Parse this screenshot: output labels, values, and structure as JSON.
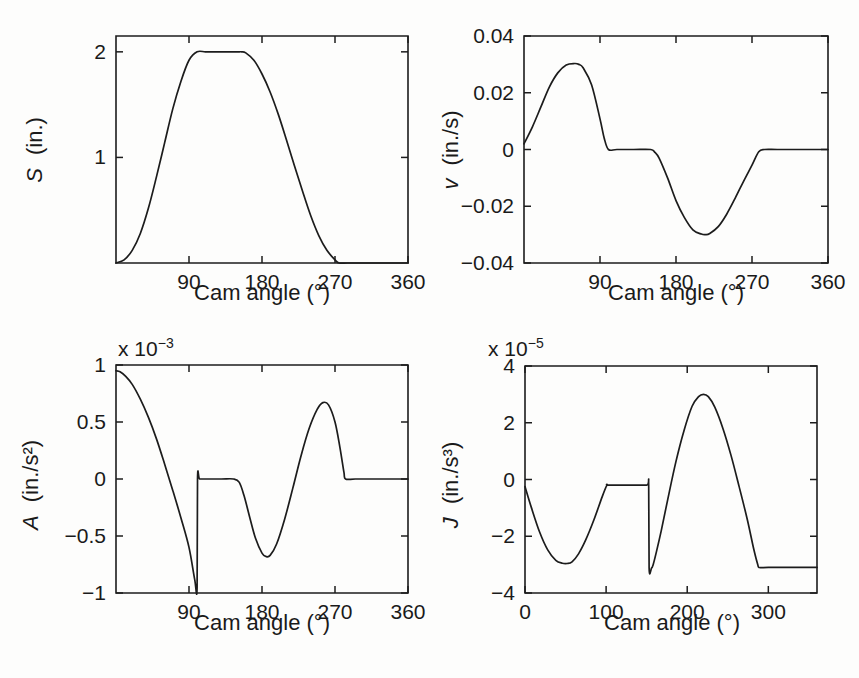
{
  "figure": {
    "name": "cam-motion-four-panel-figure",
    "background": "#fdfdfc",
    "line_color": "#1c1c1c",
    "text_color": "#1a1a1a"
  },
  "chart_data": [
    {
      "id": "panel-s",
      "type": "line",
      "title": "",
      "xlabel": "Cam angle (°)",
      "ylabel": "S (in.)",
      "ylabel_parts": {
        "symbol": "S",
        "units": "(in.)"
      },
      "exponent_label": "",
      "xlim": [
        0,
        360
      ],
      "ylim": [
        0,
        2.15
      ],
      "xticks": [
        90,
        180,
        270,
        360
      ],
      "xticklabels": [
        "90",
        "180",
        "270",
        "360"
      ],
      "yticks": [
        1,
        2
      ],
      "yticklabels": [
        "1",
        "2"
      ],
      "grid": false,
      "legend": "none",
      "x": [
        0,
        10,
        20,
        30,
        40,
        50,
        60,
        70,
        80,
        90,
        100,
        110,
        120,
        130,
        140,
        150,
        155,
        160,
        170,
        180,
        190,
        200,
        210,
        220,
        230,
        240,
        250,
        260,
        270,
        275,
        285,
        300,
        320,
        340,
        360
      ],
      "y": [
        0.0,
        0.03,
        0.12,
        0.28,
        0.52,
        0.82,
        1.14,
        1.46,
        1.72,
        1.92,
        2.0,
        2.0,
        2.0,
        2.0,
        2.0,
        2.0,
        2.0,
        1.99,
        1.92,
        1.79,
        1.62,
        1.41,
        1.17,
        0.92,
        0.68,
        0.45,
        0.26,
        0.12,
        0.03,
        0.0,
        0.0,
        0.0,
        0.0,
        0.0,
        0.0
      ]
    },
    {
      "id": "panel-v",
      "type": "line",
      "title": "",
      "xlabel": "Cam angle (°)",
      "ylabel": "v (in./s)",
      "ylabel_parts": {
        "symbol": "v",
        "units": "(in./s)"
      },
      "exponent_label": "",
      "xlim": [
        0,
        360
      ],
      "ylim": [
        -0.04,
        0.04
      ],
      "xticks": [
        90,
        180,
        270,
        360
      ],
      "xticklabels": [
        "90",
        "180",
        "270",
        "360"
      ],
      "yticks": [
        -0.04,
        -0.02,
        0,
        0.02,
        0.04
      ],
      "yticklabels": [
        "−0.04",
        "−0.02",
        "0",
        "0.02",
        "0.04"
      ],
      "grid": false,
      "legend": "none",
      "x": [
        0,
        10,
        20,
        30,
        40,
        50,
        60,
        65,
        70,
        80,
        90,
        95,
        100,
        110,
        130,
        150,
        155,
        160,
        170,
        180,
        190,
        200,
        210,
        215,
        220,
        230,
        240,
        250,
        260,
        270,
        278,
        285,
        300,
        330,
        360
      ],
      "y": [
        0.002,
        0.008,
        0.015,
        0.022,
        0.027,
        0.0298,
        0.0303,
        0.03,
        0.0288,
        0.0228,
        0.0108,
        0.004,
        0.0,
        0.0,
        0.0,
        0.0,
        -0.001,
        -0.003,
        -0.01,
        -0.018,
        -0.024,
        -0.0283,
        -0.0298,
        -0.03,
        -0.0296,
        -0.0272,
        -0.0228,
        -0.0172,
        -0.0112,
        -0.0055,
        -0.0008,
        0.0,
        0.0,
        0.0,
        0.0
      ]
    },
    {
      "id": "panel-a",
      "type": "line",
      "title": "",
      "xlabel": "Cam angle (°)",
      "ylabel": "A (in./s²)",
      "ylabel_parts": {
        "symbol": "A",
        "units": "(in./s²)"
      },
      "exponent_label": "x 10⁻³",
      "exponent_mantissa": "x 10",
      "exponent_power": "−3",
      "xlim": [
        0,
        360
      ],
      "ylim": [
        -1,
        1
      ],
      "xticks": [
        90,
        180,
        270,
        360
      ],
      "xticklabels": [
        "90",
        "180",
        "270",
        "360"
      ],
      "yticks": [
        -1,
        -0.5,
        0,
        0.5,
        1
      ],
      "yticklabels": [
        "−1",
        "−0.5",
        "0",
        "0.5",
        "1"
      ],
      "grid": false,
      "legend": "none",
      "x": [
        0,
        5,
        12,
        20,
        30,
        40,
        50,
        60,
        70,
        80,
        90,
        97,
        100,
        100.5,
        103,
        110,
        130,
        145,
        152,
        158,
        165,
        172,
        180,
        185,
        190,
        198,
        208,
        218,
        228,
        238,
        248,
        255,
        262,
        270,
        276,
        281,
        283,
        295,
        320,
        360
      ],
      "y": [
        0.95,
        0.94,
        0.9,
        0.83,
        0.7,
        0.54,
        0.35,
        0.13,
        -0.1,
        -0.34,
        -0.6,
        -0.88,
        -0.95,
        0.0,
        0.0,
        0.0,
        0.0,
        0.0,
        -0.03,
        -0.15,
        -0.34,
        -0.52,
        -0.65,
        -0.68,
        -0.67,
        -0.57,
        -0.35,
        -0.08,
        0.2,
        0.44,
        0.61,
        0.67,
        0.65,
        0.5,
        0.28,
        0.06,
        0.0,
        0.0,
        0.0,
        0.0
      ]
    },
    {
      "id": "panel-j",
      "type": "line",
      "title": "",
      "xlabel": "Cam angle (°)",
      "ylabel": "J (in./s³)",
      "ylabel_parts": {
        "symbol": "J",
        "units": "(in./s³)"
      },
      "exponent_label": "x 10⁻⁵",
      "exponent_mantissa": "x 10",
      "exponent_power": "−5",
      "xlim": [
        0,
        360
      ],
      "ylim": [
        -4,
        4
      ],
      "xticks": [
        0,
        100,
        200,
        300
      ],
      "xticklabels": [
        "0",
        "100",
        "200",
        "300"
      ],
      "yticks": [
        -4,
        -2,
        0,
        2,
        4
      ],
      "yticklabels": [
        "−4",
        "−2",
        "0",
        "2",
        "4"
      ],
      "grid": false,
      "legend": "none",
      "x": [
        0,
        8,
        18,
        28,
        38,
        46,
        52,
        58,
        66,
        75,
        85,
        95,
        101,
        103,
        130,
        150,
        152.5,
        153,
        156,
        158,
        162,
        168,
        176,
        186,
        196,
        206,
        214,
        220,
        226,
        234,
        244,
        254,
        264,
        274,
        282,
        287,
        289,
        300,
        330,
        360
      ],
      "y": [
        -0.25,
        -1.0,
        -1.85,
        -2.48,
        -2.85,
        -2.95,
        -2.96,
        -2.9,
        -2.62,
        -2.12,
        -1.42,
        -0.62,
        -0.2,
        -0.2,
        -0.2,
        -0.2,
        -0.2,
        -3.1,
        -3.12,
        -3.0,
        -2.55,
        -1.8,
        -0.7,
        0.62,
        1.72,
        2.58,
        2.92,
        3.0,
        2.92,
        2.55,
        1.8,
        0.85,
        -0.25,
        -1.4,
        -2.45,
        -3.0,
        -3.1,
        -3.1,
        -3.1,
        -3.1
      ]
    }
  ]
}
